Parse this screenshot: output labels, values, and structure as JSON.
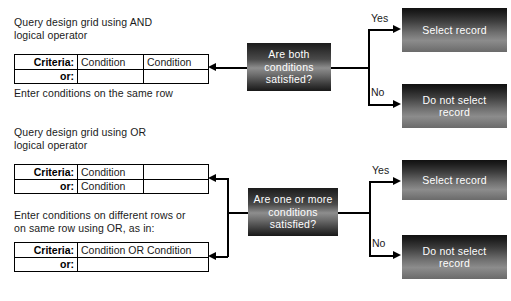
{
  "diagram": {
    "colors": {
      "line": "#000000",
      "box_dark": "#111111",
      "box_light": "#8e8e8e",
      "box_text": "#ffffff",
      "page_background": "#ffffff"
    }
  },
  "sections": {
    "and": {
      "heading": "Query design grid using AND\nlogical operator",
      "footnote": "Enter conditions on the same row",
      "grid": {
        "rows": [
          {
            "label": "Criteria:",
            "cells": [
              "Condition",
              "Condition"
            ]
          },
          {
            "label": "or:",
            "cells": [
              "",
              ""
            ]
          }
        ]
      },
      "decision": "Are both\nconditions\nsatisfied?",
      "branches": [
        {
          "label": "Yes",
          "result": "Select record"
        },
        {
          "label": "No",
          "result": "Do not select\nrecord"
        }
      ]
    },
    "or": {
      "heading": "Query design grid using OR\nlogical operator",
      "grid": {
        "rows": [
          {
            "label": "Criteria:",
            "cells": [
              "Condition",
              ""
            ]
          },
          {
            "label": "or:",
            "cells": [
              "Condition",
              ""
            ]
          }
        ]
      },
      "footnote": "Enter conditions on different rows or\non same row using OR, as in:",
      "grid2": {
        "rows": [
          {
            "label": "Criteria:",
            "cells": [
              "Condition OR Condition"
            ]
          },
          {
            "label": "or:",
            "cells": [
              ""
            ]
          }
        ]
      },
      "decision": "Are one or more\nconditions\nsatisfied?",
      "branches": [
        {
          "label": "Yes",
          "result": "Select record"
        },
        {
          "label": "No",
          "result": "Do not select\nrecord"
        }
      ]
    }
  }
}
